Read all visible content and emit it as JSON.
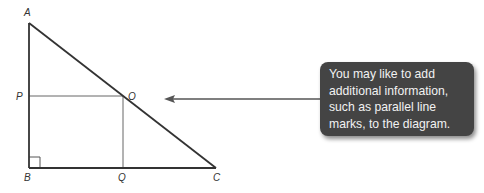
{
  "diagram": {
    "points": {
      "A": {
        "label": "A",
        "x": 29,
        "y": 23
      },
      "B": {
        "label": "B",
        "x": 29,
        "y": 168
      },
      "C": {
        "label": "C",
        "x": 216,
        "y": 168
      },
      "P": {
        "label": "P",
        "x": 29,
        "y": 96
      },
      "O": {
        "label": "O",
        "x": 123,
        "y": 96
      },
      "Q": {
        "label": "Q",
        "x": 123,
        "y": 168
      }
    },
    "right_angle_at": "B",
    "colors": {
      "triangle": "#333333",
      "construction": "#666666",
      "arrow": "#555555",
      "callout_bg": "#444444",
      "callout_text": "#f2f2f2"
    }
  },
  "callout": {
    "lines": [
      "You may like to add",
      "additional information,",
      "such as parallel line",
      "marks, to the diagram."
    ]
  }
}
